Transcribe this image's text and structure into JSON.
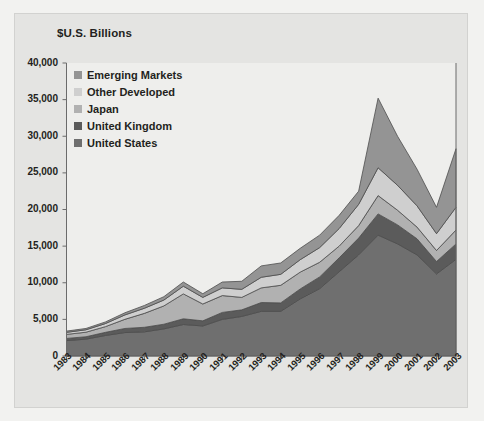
{
  "chart_data": {
    "type": "area",
    "stacked": true,
    "title": "$U.S. Billions",
    "xlabel": "",
    "ylabel": "",
    "ylim": [
      0,
      40000
    ],
    "ytick_values": [
      0,
      5000,
      10000,
      15000,
      20000,
      25000,
      30000,
      35000,
      40000
    ],
    "ytick_labels": [
      "0",
      "5,000",
      "10,000",
      "15,000",
      "20,000",
      "25,000",
      "30,000",
      "35,000",
      "40,000"
    ],
    "grid": false,
    "legend_position": "upper-left-inside",
    "categories": [
      "1983",
      "1984",
      "1985",
      "1986",
      "1987",
      "1988",
      "1989",
      "1990",
      "1991",
      "1992",
      "1993",
      "1994",
      "1995",
      "1996",
      "1997",
      "1998",
      "1999",
      "2000",
      "2001",
      "2002",
      "2003"
    ],
    "series": [
      {
        "name": "United States",
        "color": "#6f6f6f",
        "values": [
          2100,
          2300,
          2800,
          3200,
          3300,
          3700,
          4300,
          4100,
          5000,
          5400,
          6100,
          6100,
          7800,
          9200,
          11500,
          13800,
          16500,
          15300,
          13800,
          11200,
          13200
        ]
      },
      {
        "name": "United Kingdom",
        "color": "#5b5b5b",
        "values": [
          300,
          330,
          430,
          560,
          620,
          640,
          780,
          700,
          950,
          900,
          1200,
          1150,
          1350,
          1600,
          1900,
          2300,
          2900,
          2600,
          2200,
          1700,
          2100
        ]
      },
      {
        "name": "Japan",
        "color": "#b1b1b1",
        "values": [
          550,
          620,
          780,
          1250,
          1900,
          2500,
          3400,
          2300,
          2300,
          1700,
          2000,
          2400,
          2300,
          2000,
          1600,
          1700,
          2500,
          2000,
          1600,
          1500,
          1900
        ]
      },
      {
        "name": "Other Developed",
        "color": "#cfcfcf",
        "values": [
          280,
          330,
          420,
          600,
          700,
          800,
          1050,
          900,
          1050,
          1100,
          1450,
          1500,
          1700,
          2000,
          2400,
          2900,
          3800,
          3400,
          2900,
          2300,
          3100
        ]
      },
      {
        "name": "Emerging Markets",
        "color": "#949494",
        "values": [
          170,
          180,
          220,
          290,
          380,
          460,
          570,
          500,
          800,
          1100,
          1550,
          1550,
          1550,
          1700,
          1800,
          1800,
          9500,
          6700,
          5000,
          3600,
          8000
        ]
      }
    ],
    "series_stack_order_bottom_to_top": [
      "United States",
      "United Kingdom",
      "Japan",
      "Other Developed",
      "Emerging Markets"
    ],
    "stacked_totals": [
      3400,
      3760,
      4650,
      5900,
      6900,
      8100,
      10100,
      8500,
      10100,
      10200,
      12300,
      12700,
      14700,
      16500,
      19200,
      22500,
      35200,
      30000,
      25500,
      20300,
      28300
    ]
  },
  "legend": {
    "items": [
      {
        "label": "Emerging Markets",
        "color": "#949494"
      },
      {
        "label": "Other Developed",
        "color": "#cfcfcf"
      },
      {
        "label": "Japan",
        "color": "#b1b1b1"
      },
      {
        "label": "United Kingdom",
        "color": "#5b5b5b"
      },
      {
        "label": "United States",
        "color": "#6f6f6f"
      }
    ]
  },
  "style": {
    "figure_background": "#f2f2f0",
    "panel_background": "#e4e4e2",
    "plot_background": "#eeeeec",
    "axis_color": "#6b6b6b",
    "text_color": "#231f20",
    "series_outline": "#4d4d4d"
  }
}
